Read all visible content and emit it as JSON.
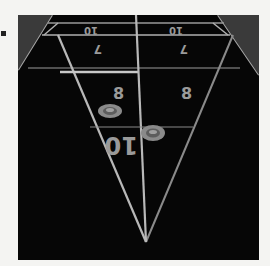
{
  "scene": {
    "subject": "Shuffleboard table scoring end, viewed from above",
    "colors": {
      "background": "#f4f4f2",
      "board": "#060606",
      "lines": "#bdbdbd",
      "numbers": "#9a9a9a",
      "puck": "#8a8a8a"
    }
  },
  "scoring_zones": [
    {
      "label": "10",
      "position": "top-left",
      "orientation": "inverted"
    },
    {
      "label": "10",
      "position": "top-right",
      "orientation": "inverted"
    },
    {
      "label": "7",
      "position": "second-row-left",
      "orientation": "inverted"
    },
    {
      "label": "7",
      "position": "second-row-right",
      "orientation": "inverted"
    },
    {
      "label": "8",
      "position": "triangle-left"
    },
    {
      "label": "8",
      "position": "triangle-right"
    },
    {
      "label": "10",
      "position": "triangle-tip",
      "orientation": "inverted"
    }
  ],
  "labels": {
    "top_left": "10",
    "top_right": "10",
    "row2_left": "7",
    "row2_right": "7",
    "tri_left": "8",
    "tri_right": "8",
    "tri_tip": "10"
  },
  "pucks": [
    {
      "name": "puck-1",
      "zone": "8 (left)"
    },
    {
      "name": "puck-2",
      "zone": "on center line near 10"
    }
  ]
}
